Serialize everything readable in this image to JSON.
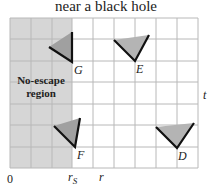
{
  "title": "near a black hole",
  "region": {
    "label_line1": "No-escape",
    "label_line2": "region",
    "fill": "#d6d6d6"
  },
  "axes": {
    "origin_label": "0",
    "rs_label": "r",
    "rs_subscript": "S",
    "x_label": "r",
    "y_label": "t"
  },
  "grid": {
    "columns": 9,
    "rows": 7,
    "line_color": "#b8b8b8"
  },
  "light_cones": [
    {
      "label": "G",
      "vertex": [
        72,
        62
      ],
      "left": [
        49,
        47
      ],
      "right": [
        72,
        32
      ]
    },
    {
      "label": "E",
      "vertex": [
        135,
        61
      ],
      "left": [
        114,
        40
      ],
      "right": [
        149,
        35
      ]
    },
    {
      "label": "F",
      "vertex": [
        75,
        147
      ],
      "left": [
        54,
        126
      ],
      "right": [
        80,
        118
      ]
    },
    {
      "label": "D",
      "vertex": [
        177,
        148
      ],
      "left": [
        156,
        127
      ],
      "right": [
        194,
        123
      ]
    }
  ],
  "colors": {
    "cone_fill": "#a8a8a8",
    "cone_edge": "#111111"
  }
}
